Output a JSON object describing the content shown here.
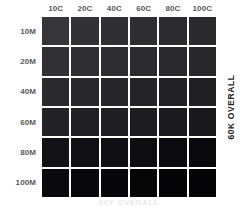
{
  "chart_data": {
    "type": "heatmap",
    "title": "",
    "subtitle": "",
    "xlabel": "60Y OVERALL",
    "ylabel": "60K OVERALL",
    "grid": false,
    "legend": "none",
    "x": [
      "10C",
      "20C",
      "40C",
      "60C",
      "80C",
      "100C"
    ],
    "categories": [
      "10C",
      "20C",
      "40C",
      "60C",
      "80C",
      "100C"
    ],
    "y": [
      "10M",
      "20M",
      "40M",
      "60M",
      "80M",
      "100M"
    ],
    "xtick_labels": [
      "10C",
      "20C",
      "40C",
      "60C",
      "80C",
      "100C"
    ],
    "ytick_labels": [
      "10M",
      "20M",
      "40M",
      "60M",
      "80M",
      "100M"
    ],
    "series": [
      {
        "name": "10M",
        "values": [
          "#35353a",
          "#323236",
          "#303034",
          "#2e2e32",
          "#2c2c30",
          "#2a2a2e"
        ]
      },
      {
        "name": "20M",
        "values": [
          "#313135",
          "#2f2f33",
          "#2d2d31",
          "#2b2b2f",
          "#29292d",
          "#27272b"
        ]
      },
      {
        "name": "40M",
        "values": [
          "#2a2a2e",
          "#28282c",
          "#26262a",
          "#242428",
          "#222226",
          "#202024"
        ]
      },
      {
        "name": "60M",
        "values": [
          "#232327",
          "#212125",
          "#1f1f23",
          "#1d1d21",
          "#1b1b1f",
          "#19191d"
        ]
      },
      {
        "name": "80M",
        "values": [
          "#131317",
          "#111115",
          "#0f0f13",
          "#0d0d11",
          "#0b0b0f",
          "#09090d"
        ]
      },
      {
        "name": "100M",
        "values": [
          "#0a0a0e",
          "#08080c",
          "#07070b",
          "#060609",
          "#050508",
          "#040407"
        ]
      }
    ],
    "cells": [
      [
        "#35353a",
        "#323236",
        "#303034",
        "#2e2e32",
        "#2c2c30",
        "#2a2a2e"
      ],
      [
        "#313135",
        "#2f2f33",
        "#2d2d31",
        "#2b2b2f",
        "#29292d",
        "#27272b"
      ],
      [
        "#2a2a2e",
        "#28282c",
        "#26262a",
        "#242428",
        "#222226",
        "#202024"
      ],
      [
        "#232327",
        "#212125",
        "#1f1f23",
        "#1d1d21",
        "#1b1b1f",
        "#19191d"
      ],
      [
        "#131317",
        "#111115",
        "#0f0f13",
        "#0d0d11",
        "#0b0b0f",
        "#09090d"
      ],
      [
        "#0a0a0e",
        "#08080c",
        "#07070b",
        "#060609",
        "#050508",
        "#040407"
      ]
    ]
  },
  "colors": {
    "background": "#ffffff",
    "label": "#58595b",
    "axis_title_right": "#231f20",
    "axis_title_bottom": "#e9e9ea"
  },
  "axes": {
    "bottom_title": "60Y OVERALL",
    "right_title": "60K OVERALL"
  }
}
